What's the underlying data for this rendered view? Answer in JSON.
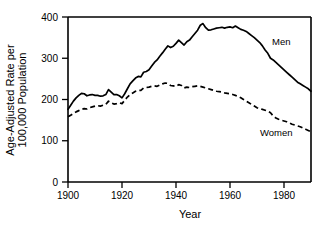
{
  "chart_data": {
    "type": "line",
    "title": "",
    "subtitle": "",
    "xlabel": "Year",
    "ylabel": "Age-Adjusted Rate per 100,000 Population",
    "ylabel_line1": "Age-Adjusted Rate per",
    "ylabel_line2": "100,000 Population",
    "xlim": [
      1900,
      1990
    ],
    "ylim": [
      0,
      400
    ],
    "xticks": [
      1900,
      1920,
      1940,
      1960,
      1980
    ],
    "yticks": [
      0,
      100,
      200,
      300,
      400
    ],
    "xtick_labels": [
      "1900",
      "1920",
      "1940",
      "1960",
      "1980"
    ],
    "ytick_labels": [
      "0",
      "100",
      "200",
      "300",
      "400"
    ],
    "grid": false,
    "legend_position": "inline-annotation",
    "x": [
      1900,
      1901,
      1902,
      1903,
      1904,
      1905,
      1906,
      1907,
      1908,
      1909,
      1910,
      1911,
      1912,
      1913,
      1914,
      1915,
      1916,
      1917,
      1918,
      1919,
      1920,
      1921,
      1922,
      1923,
      1924,
      1925,
      1926,
      1927,
      1928,
      1929,
      1930,
      1931,
      1932,
      1933,
      1934,
      1935,
      1936,
      1937,
      1938,
      1939,
      1940,
      1941,
      1942,
      1943,
      1944,
      1945,
      1946,
      1947,
      1948,
      1949,
      1950,
      1951,
      1952,
      1953,
      1954,
      1955,
      1956,
      1957,
      1958,
      1959,
      1960,
      1961,
      1962,
      1963,
      1964,
      1965,
      1966,
      1967,
      1968,
      1969,
      1970,
      1971,
      1972,
      1973,
      1974,
      1975,
      1976,
      1977,
      1978,
      1979,
      1980,
      1981,
      1982,
      1983,
      1984,
      1985,
      1986,
      1987,
      1988,
      1989,
      1990
    ],
    "series": [
      {
        "name": "Men",
        "style": "solid",
        "label": "Men",
        "values": [
          176,
          186,
          196,
          204,
          210,
          215,
          214,
          209,
          211,
          212,
          210,
          210,
          208,
          209,
          212,
          224,
          218,
          212,
          212,
          209,
          204,
          214,
          226,
          238,
          245,
          252,
          256,
          255,
          266,
          268,
          272,
          281,
          290,
          296,
          305,
          313,
          322,
          330,
          326,
          329,
          336,
          344,
          338,
          332,
          340,
          344,
          352,
          360,
          368,
          380,
          384,
          374,
          368,
          369,
          371,
          373,
          374,
          375,
          373,
          375,
          376,
          374,
          378,
          374,
          370,
          368,
          365,
          360,
          355,
          350,
          344,
          338,
          330,
          320,
          312,
          300,
          296,
          290,
          284,
          278,
          272,
          266,
          260,
          254,
          248,
          242,
          238,
          234,
          230,
          226,
          220
        ]
      },
      {
        "name": "Women",
        "style": "dashed",
        "label": "Women",
        "values": [
          158,
          162,
          166,
          170,
          173,
          176,
          178,
          177,
          180,
          182,
          184,
          185,
          184,
          186,
          188,
          196,
          192,
          189,
          190,
          192,
          190,
          198,
          206,
          212,
          216,
          220,
          222,
          222,
          228,
          229,
          230,
          232,
          233,
          232,
          235,
          238,
          240,
          239,
          234,
          233,
          232,
          236,
          234,
          228,
          230,
          229,
          231,
          232,
          233,
          232,
          230,
          228,
          226,
          224,
          222,
          220,
          219,
          218,
          216,
          215,
          214,
          212,
          210,
          207,
          204,
          200,
          196,
          192,
          188,
          184,
          180,
          178,
          176,
          174,
          172,
          168,
          160,
          155,
          152,
          150,
          148,
          146,
          143,
          140,
          138,
          136,
          134,
          131,
          128,
          125,
          122
        ]
      }
    ],
    "annotations": [
      {
        "text": "Men",
        "x": 1978,
        "y": 340
      },
      {
        "text": "Women",
        "x": 1973,
        "y": 152
      }
    ]
  }
}
